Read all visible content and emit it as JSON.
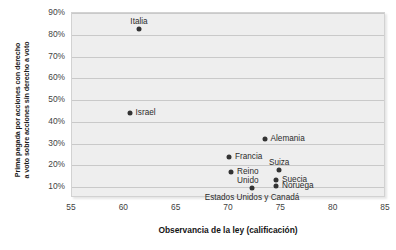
{
  "chart_data": {
    "type": "scatter",
    "title": "",
    "xlabel": "Observancia de la ley (calificación)",
    "ylabel_line1": "Prima pagada por acciones con derecho",
    "ylabel_line2": "a voto sobre acciones sin derecho a voto",
    "xlim": [
      55,
      85
    ],
    "ylim": [
      0.05,
      0.9
    ],
    "xticks": [
      "55",
      "60",
      "65",
      "70",
      "75",
      "80",
      "85"
    ],
    "xtick_values": [
      55,
      60,
      65,
      70,
      75,
      80,
      85
    ],
    "yticks": [
      "10%",
      "20%",
      "30%",
      "40%",
      "50%",
      "60%",
      "70%",
      "80%",
      "90%"
    ],
    "ytick_values": [
      0.1,
      0.2,
      0.3,
      0.4,
      0.5,
      0.6,
      0.7,
      0.8,
      0.9
    ],
    "grid": true,
    "legend": "none",
    "points": [
      {
        "label": "Italia",
        "x": 61.4,
        "y": 0.825,
        "label_pos": "center",
        "label_dx": 0,
        "label_dy": -12
      },
      {
        "label": "Israel",
        "x": 60.5,
        "y": 0.44,
        "label_pos": "right",
        "label_dx": 6,
        "label_dy": -5
      },
      {
        "label": "Alemania",
        "x": 73.4,
        "y": 0.32,
        "label_pos": "right",
        "label_dx": 6,
        "label_dy": -5
      },
      {
        "label": "Francia",
        "x": 70.0,
        "y": 0.24,
        "label_pos": "right",
        "label_dx": 6,
        "label_dy": -5
      },
      {
        "label": "Suiza",
        "x": 74.8,
        "y": 0.18,
        "label_pos": "center",
        "label_dx": 0,
        "label_dy": -12
      },
      {
        "label": "Reino\nUnido",
        "x": 70.2,
        "y": 0.17,
        "label_pos": "right",
        "label_dx": 6,
        "label_dy": -5
      },
      {
        "label": "Suecia",
        "x": 74.5,
        "y": 0.135,
        "label_pos": "right",
        "label_dx": 6,
        "label_dy": -5
      },
      {
        "label": "Noruega",
        "x": 74.5,
        "y": 0.105,
        "label_pos": "right",
        "label_dx": 6,
        "label_dy": -5
      },
      {
        "label": "Estados Unidos y Canadá",
        "x": 72.2,
        "y": 0.095,
        "label_pos": "center",
        "label_dx": 0,
        "label_dy": 5
      }
    ],
    "colors": {
      "plot_background": "#eeeeee",
      "gridline": "#c9c9c9",
      "point": "#333333",
      "text": "#2b2b2b",
      "tick_text": "#3f3f3f"
    }
  }
}
